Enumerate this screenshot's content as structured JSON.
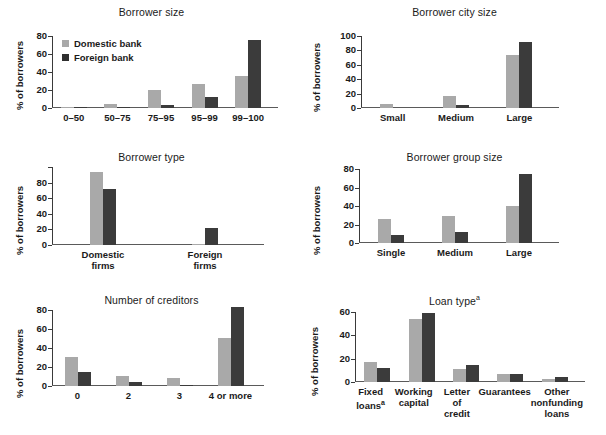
{
  "figure": {
    "ylabel": "% of borrowers",
    "legend": [
      {
        "key": "dom",
        "label": "Domestic bank",
        "color": "#a9a9a9"
      },
      {
        "key": "for",
        "label": "Foreign bank",
        "color": "#2f2f2f"
      }
    ]
  },
  "chart_data": [
    {
      "type": "bar",
      "title": "Borrower size",
      "xlabel": "",
      "ylabel": "% of borrowers",
      "ylim": [
        0,
        80
      ],
      "yticks": [
        0,
        20,
        40,
        60,
        80
      ],
      "grid": false,
      "legend_position": "upper-left",
      "categories": [
        "0–50",
        "50–75",
        "75–95",
        "95–99",
        "99–100"
      ],
      "series": [
        {
          "name": "Domestic bank",
          "values": [
            1,
            5,
            20,
            27,
            36
          ]
        },
        {
          "name": "Foreign bank",
          "values": [
            1,
            1,
            3,
            12,
            76
          ]
        }
      ]
    },
    {
      "type": "bar",
      "title": "Borrower city size",
      "xlabel": "",
      "ylabel": "% of borrowers",
      "ylim": [
        0,
        100
      ],
      "yticks": [
        0,
        20,
        40,
        60,
        80,
        100
      ],
      "grid": false,
      "categories": [
        "Small",
        "Medium",
        "Large"
      ],
      "series": [
        {
          "name": "Domestic bank",
          "values": [
            6,
            16,
            73
          ]
        },
        {
          "name": "Foreign bank",
          "values": [
            0,
            4,
            92
          ]
        }
      ]
    },
    {
      "type": "bar",
      "title": "Borrower type",
      "xlabel": "",
      "ylabel": "% of borrowers",
      "ylim": [
        0,
        100
      ],
      "yticks": [
        0,
        20,
        40,
        60,
        80,
        100
      ],
      "ytick_labels": [
        "0",
        "20",
        "40",
        "60",
        "80",
        ""
      ],
      "grid": false,
      "categories": [
        "Domestic firms",
        "Foreign firms"
      ],
      "series": [
        {
          "name": "Domestic bank",
          "values": [
            94,
            1
          ]
        },
        {
          "name": "Foreign bank",
          "values": [
            72,
            22
          ]
        }
      ]
    },
    {
      "type": "bar",
      "title": "Borrower group size",
      "xlabel": "",
      "ylabel": "% of borrowers",
      "ylim": [
        0,
        80
      ],
      "yticks": [
        0,
        20,
        40,
        60,
        80
      ],
      "grid": false,
      "categories": [
        "Single",
        "Medium",
        "Large"
      ],
      "series": [
        {
          "name": "Domestic bank",
          "values": [
            26,
            29,
            40
          ]
        },
        {
          "name": "Foreign bank",
          "values": [
            9,
            12,
            75
          ]
        }
      ]
    },
    {
      "type": "bar",
      "title": "Number of creditors",
      "xlabel": "",
      "ylabel": "% of borrowers",
      "ylim": [
        0,
        80
      ],
      "yticks": [
        0,
        20,
        40,
        60,
        80
      ],
      "grid": false,
      "categories": [
        "0",
        "2",
        "3",
        "4 or more"
      ],
      "series": [
        {
          "name": "Domestic bank",
          "values": [
            31,
            11,
            8,
            51
          ]
        },
        {
          "name": "Foreign bank",
          "values": [
            15,
            4,
            1,
            83
          ]
        }
      ]
    },
    {
      "type": "bar",
      "title": "Loan type",
      "title_footnote": "a",
      "xlabel": "",
      "ylabel": "% of borrowers",
      "ylim": [
        0,
        60
      ],
      "yticks": [
        0,
        20,
        40,
        60
      ],
      "grid": false,
      "categories": [
        "Fixed loans",
        "Working capital",
        "Letter of credit",
        "Guarantees",
        "Other nonfunding loans"
      ],
      "category_footnotes": [
        "a",
        "",
        "",
        "",
        ""
      ],
      "series": [
        {
          "name": "Domestic bank",
          "values": [
            17,
            54,
            11,
            7,
            3
          ]
        },
        {
          "name": "Foreign bank",
          "values": [
            12,
            59,
            15,
            7,
            4
          ]
        }
      ]
    }
  ]
}
